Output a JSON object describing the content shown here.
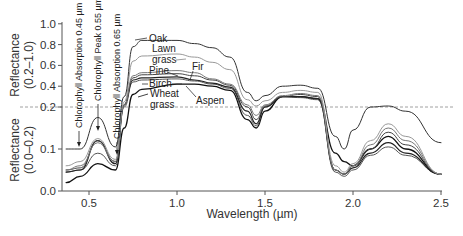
{
  "chart_data": {
    "type": "line",
    "title": "",
    "xlabel": "Wavelength (µm)",
    "ylabel_upper": [
      "Reflectance",
      "(0.2–1.0)"
    ],
    "ylabel_lower": [
      "Reflectance",
      "(0.0–0.2)"
    ],
    "xlim": [
      0.35,
      2.5
    ],
    "x_ticks": [
      0.5,
      1.0,
      1.5,
      2.0,
      2.5
    ],
    "x_tick_labels": [
      "0.5",
      "1.0",
      "1.5",
      "2.0",
      "2.5"
    ],
    "y_upper_ticks": [
      1.0,
      0.8,
      0.6,
      0.4,
      0.2
    ],
    "y_upper_tick_labels": [
      "1.0",
      "0.8",
      "0.6",
      "0.4",
      "0.2"
    ],
    "y_lower_ticks": [
      0.2,
      0.1,
      0.0
    ],
    "y_lower_tick_labels": [
      "0.2",
      "0.1",
      "0.0"
    ],
    "split_axis_at": 0.2,
    "grid": false,
    "annotations": [
      {
        "text": "Chlorophyll Absorption 0.45 µm",
        "x": 0.45
      },
      {
        "text": "Chlorophyll Peak 0.55 µm",
        "x": 0.55
      },
      {
        "text": "Chlorophyll Absorption 0.65 µm",
        "x": 0.65
      }
    ],
    "x": [
      0.37,
      0.45,
      0.55,
      0.65,
      0.7,
      0.75,
      0.8,
      1.0,
      1.1,
      1.2,
      1.3,
      1.4,
      1.45,
      1.5,
      1.6,
      1.7,
      1.8,
      1.9,
      1.95,
      2.0,
      2.1,
      2.2,
      2.3,
      2.5
    ],
    "series": [
      {
        "name": "Oak",
        "color": "#333333",
        "width": 1.0,
        "values": [
          0.1,
          0.1,
          0.175,
          0.105,
          0.3,
          0.78,
          0.84,
          0.84,
          0.81,
          0.77,
          0.68,
          0.34,
          0.26,
          0.31,
          0.4,
          0.41,
          0.38,
          0.13,
          0.1,
          0.145,
          0.2,
          0.21,
          0.19,
          0.115
        ]
      },
      {
        "name": "Lawn grass",
        "color": "#999999",
        "width": 1.0,
        "values": [
          0.06,
          0.07,
          0.125,
          0.075,
          0.25,
          0.64,
          0.69,
          0.71,
          0.68,
          0.63,
          0.56,
          0.27,
          0.21,
          0.26,
          0.34,
          0.36,
          0.34,
          0.06,
          0.045,
          0.065,
          0.12,
          0.16,
          0.13,
          0.04
        ]
      },
      {
        "name": "Fir",
        "color": "#777777",
        "width": 1.0,
        "values": [
          0.05,
          0.06,
          0.115,
          0.07,
          0.22,
          0.5,
          0.53,
          0.55,
          0.53,
          0.47,
          0.42,
          0.22,
          0.18,
          0.22,
          0.31,
          0.33,
          0.31,
          0.05,
          0.04,
          0.06,
          0.11,
          0.15,
          0.12,
          0.04
        ]
      },
      {
        "name": "Pine",
        "color": "#444444",
        "width": 1.0,
        "values": [
          0.05,
          0.055,
          0.12,
          0.07,
          0.22,
          0.48,
          0.51,
          0.52,
          0.5,
          0.46,
          0.41,
          0.2,
          0.17,
          0.21,
          0.3,
          0.32,
          0.3,
          0.05,
          0.04,
          0.06,
          0.1,
          0.14,
          0.11,
          0.04
        ]
      },
      {
        "name": "Birch",
        "color": "#222222",
        "width": 1.2,
        "values": [
          0.045,
          0.05,
          0.12,
          0.065,
          0.22,
          0.46,
          0.48,
          0.49,
          0.46,
          0.43,
          0.39,
          0.19,
          0.16,
          0.2,
          0.3,
          0.3,
          0.28,
          0.05,
          0.04,
          0.055,
          0.09,
          0.115,
          0.09,
          0.04
        ]
      },
      {
        "name": "Aspen",
        "color": "#555555",
        "width": 1.0,
        "values": [
          0.045,
          0.05,
          0.09,
          0.06,
          0.2,
          0.44,
          0.46,
          0.47,
          0.45,
          0.42,
          0.38,
          0.18,
          0.155,
          0.2,
          0.3,
          0.29,
          0.27,
          0.045,
          0.035,
          0.05,
          0.085,
          0.105,
          0.085,
          0.04
        ]
      },
      {
        "name": "Wheat grass",
        "color": "#111111",
        "width": 1.3,
        "values": [
          0.02,
          0.035,
          0.065,
          0.05,
          0.15,
          0.32,
          0.37,
          0.42,
          0.42,
          0.4,
          0.36,
          0.17,
          0.15,
          0.19,
          0.3,
          0.3,
          0.28,
          0.09,
          0.07,
          0.06,
          0.1,
          0.13,
          0.1,
          0.04
        ]
      }
    ],
    "series_labels": [
      {
        "series": "Oak",
        "lines": [
          "Oak"
        ]
      },
      {
        "series": "Lawn grass",
        "lines": [
          "Lawn",
          "grass"
        ]
      },
      {
        "series": "Fir",
        "lines": [
          "Fir"
        ]
      },
      {
        "series": "Pine",
        "lines": [
          "Pine"
        ]
      },
      {
        "series": "Birch",
        "lines": [
          "Birch"
        ]
      },
      {
        "series": "Wheat grass",
        "lines": [
          "Wheat",
          "grass"
        ]
      },
      {
        "series": "Aspen",
        "lines": [
          "Aspen"
        ]
      }
    ]
  }
}
